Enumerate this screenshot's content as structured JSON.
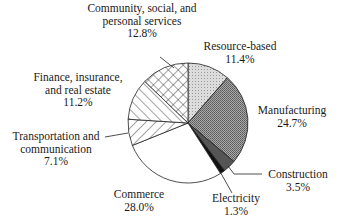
{
  "chart_data": {
    "type": "pie",
    "title": "",
    "start_angle_deg": 0,
    "direction": "clockwise",
    "slices": [
      {
        "label": "Resource-based",
        "value": 11.4,
        "pct_label": "11.4%",
        "fill": "light-stipple"
      },
      {
        "label": "Manufacturing",
        "value": 24.7,
        "pct_label": "24.7%",
        "fill": "dark-stipple"
      },
      {
        "label": "Construction",
        "value": 3.5,
        "pct_label": "3.5%",
        "fill": "dark-gray"
      },
      {
        "label": "Electricity",
        "value": 1.3,
        "pct_label": "1.3%",
        "fill": "black"
      },
      {
        "label": "Commerce",
        "value": 28.0,
        "pct_label": "28.0%",
        "fill": "white"
      },
      {
        "label": "Transportation and communication",
        "value": 7.1,
        "pct_label": "7.1%",
        "fill": "diagonal-forward"
      },
      {
        "label": "Finance, insurance, and real estate",
        "value": 11.2,
        "pct_label": "11.2%",
        "fill": "diagonal-back"
      },
      {
        "label": "Community, social, and personal services",
        "value": 12.8,
        "pct_label": "12.8%",
        "fill": "crosshatch"
      }
    ]
  },
  "labels": {
    "resource": {
      "line1": "Resource-based",
      "pct": "11.4%"
    },
    "manufacturing": {
      "line1": "Manufacturing",
      "pct": "24.7%"
    },
    "construction": {
      "line1": "Construction",
      "pct": "3.5%"
    },
    "electricity": {
      "line1": "Electricity",
      "pct": "1.3%"
    },
    "commerce": {
      "line1": "Commerce",
      "pct": "28.0%"
    },
    "transport": {
      "line1": "Transportation and",
      "line2": "communication",
      "pct": "7.1%"
    },
    "finance": {
      "line1": "Finance, insurance,",
      "line2": "and real estate",
      "pct": "11.2%"
    },
    "community": {
      "line1": "Community, social, and",
      "line2": "personal services",
      "pct": "12.8%"
    }
  }
}
